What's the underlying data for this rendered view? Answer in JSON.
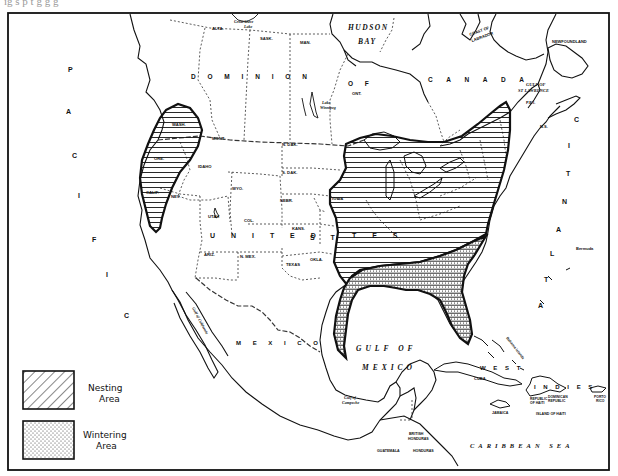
{
  "page": {
    "top_caption_fragment": "ig s  p  t   g  g   g"
  },
  "map": {
    "ocean_labels": {
      "pacific": [
        "P",
        "A",
        "C",
        "I",
        "F",
        "I",
        "C"
      ],
      "atlantic": [
        "A",
        "T",
        "L",
        "A",
        "N",
        "T",
        "I",
        "C"
      ],
      "hudson_bay_1": "HUDSON",
      "hudson_bay_2": "BAY",
      "gulf_of_mexico_1": "GULF  OF",
      "gulf_of_mexico_2": "MEXICO",
      "caribbean_sea": "CARIBBEAN   SEA",
      "gulf_st_lawrence_1": "GULF OF",
      "gulf_st_lawrence_2": "ST LAWRENCE",
      "gulf_of_campeche_1": "Gulf of",
      "gulf_of_campeche_2": "Campeche",
      "gulf_of_california": "Gulf of California"
    },
    "country_labels": {
      "dominion": "D O M I N I O N",
      "of": "O F",
      "canada": "C A N A D A",
      "united_states_1": "U N I T E D",
      "united_states_2": "S T",
      "united_states_3": "T E S",
      "mexico": "M E X I C O",
      "west_indies_1": "W E S T",
      "west_indies_2": "I N D I E S"
    },
    "region_labels": {
      "alta": "ALTA.",
      "sask": "SASK.",
      "man": "MAN.",
      "ont": "ONT.",
      "great_slave_lake_1": "Great Slave",
      "great_slave_lake_2": "Lake",
      "lake_winnipeg_1": "Lake",
      "lake_winnipeg_2": "Winnipeg",
      "coast_of_labrador_1": "COAST OF",
      "coast_of_labrador_2": "LABRADOR",
      "newfoundland": "NEWFOUNDLAND",
      "ns": "N.S.",
      "pei": "P.E.I.",
      "wash": "WASH.",
      "ore": "ORE.",
      "calif": "CALIF.",
      "idaho": "IDAHO",
      "mont": "MONT.",
      "wyo": "WYO.",
      "nev": "NEV.",
      "utah": "UTAH",
      "col": "COL.",
      "ariz": "ARIZ.",
      "n_mex": "N. MEX.",
      "n_dak": "N. DAK.",
      "s_dak": "S. DAK.",
      "nebr": "NEBR.",
      "kans": "KANS.",
      "okla": "OKLA.",
      "texas": "TEXAS",
      "iowa": "IOWA",
      "bermuda": "Bermuda",
      "bahama_islands": "Bahama Islands",
      "cuba": "CUBA",
      "jamaica": "JAMAICA",
      "republic_of_haiti_1": "REPUBLIC",
      "republic_of_haiti_2": "OF HAITI",
      "dominican_republic_1": "DOMINICAN",
      "dominican_republic_2": "REPUBLIC",
      "island_of_haiti": "ISLAND OF HAITI",
      "porto_rico_1": "PORTO",
      "porto_rico_2": "RICO",
      "british_honduras_1": "BRITISH",
      "british_honduras_2": "HONDURAS",
      "guatemala": "GUATEMALA",
      "honduras": "HONDURAS"
    },
    "colors": {
      "ink": "#111111",
      "paper": "#ffffff",
      "boundary_dotted": "#333333"
    }
  },
  "legend": {
    "items": [
      {
        "pattern": "diagonal-hatch",
        "line1": "Nesting",
        "line2": "Area"
      },
      {
        "pattern": "dot-stipple",
        "line1": "Wintering",
        "line2": "Area"
      }
    ]
  }
}
